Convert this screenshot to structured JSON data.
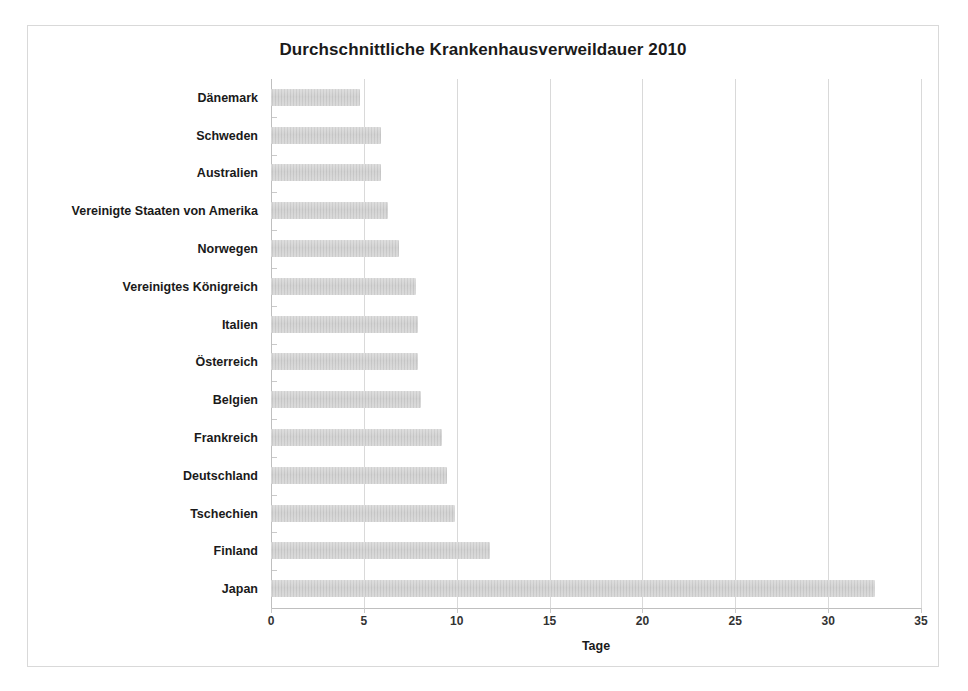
{
  "chart_data": {
    "type": "bar",
    "orientation": "horizontal",
    "title": "Durchschnittliche Krankenhausverweildauer 2010",
    "xlabel": "Tage",
    "ylabel": "",
    "xlim": [
      0,
      35
    ],
    "xticks": [
      0,
      5,
      10,
      15,
      20,
      25,
      30,
      35
    ],
    "xtick_labels": [
      "0",
      "5",
      "10",
      "15",
      "20",
      "25",
      "30",
      "35"
    ],
    "grid": true,
    "grid_axis": "x",
    "legend": false,
    "bar_color": "#c9c9c9",
    "categories": [
      "Dänemark",
      "Schweden",
      "Australien",
      "Vereinigte Staaten von Amerika",
      "Norwegen",
      "Vereinigtes Königreich",
      "Italien",
      "Österreich",
      "Belgien",
      "Frankreich",
      "Deutschland",
      "Tschechien",
      "Finland",
      "Japan"
    ],
    "values": [
      4.8,
      5.9,
      5.9,
      6.3,
      6.9,
      7.8,
      7.9,
      7.9,
      8.1,
      9.2,
      9.5,
      9.9,
      11.8,
      32.5
    ],
    "series": [
      {
        "name": "Tage",
        "values": [
          4.8,
          5.9,
          5.9,
          6.3,
          6.9,
          7.8,
          7.9,
          7.9,
          8.1,
          9.2,
          9.5,
          9.9,
          11.8,
          32.5
        ]
      }
    ]
  }
}
